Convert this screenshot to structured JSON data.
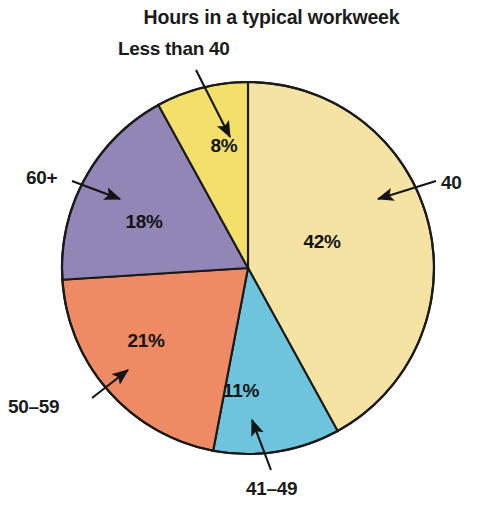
{
  "chart": {
    "title": "Hours in a typical workweek"
  },
  "chart_data": {
    "type": "pie",
    "title": "Hours in a typical workweek",
    "xlabel": "",
    "ylabel": "",
    "grid": false,
    "legend_position": "callout-labels",
    "start_angle_deg": 0,
    "direction": "clockwise",
    "categories": [
      "40",
      "41–49",
      "50–59",
      "60+",
      "Less than 40"
    ],
    "values": [
      42,
      11,
      21,
      18,
      8
    ],
    "value_labels": [
      "42%",
      "11%",
      "21%",
      "18%",
      "8%"
    ],
    "colors": [
      "#f5e3a3",
      "#6ec3dd",
      "#ee8a64",
      "#9186b5",
      "#f2e06a"
    ],
    "slices": [
      {
        "label": "40",
        "value": 42,
        "value_label": "42%",
        "color": "#f5e3a3",
        "start_deg": 0,
        "end_deg": 151.2,
        "pct_label_x": 322,
        "pct_label_y": 242,
        "callout_x": 441,
        "callout_y": 172
      },
      {
        "label": "41–49",
        "value": 11,
        "value_label": "11%",
        "color": "#6ec3dd",
        "start_deg": 151.2,
        "end_deg": 190.8,
        "pct_label_x": 241,
        "pct_label_y": 391,
        "callout_x": 246,
        "callout_y": 478
      },
      {
        "label": "50–59",
        "value": 21,
        "value_label": "21%",
        "color": "#ee8a64",
        "start_deg": 190.8,
        "end_deg": 266.4,
        "pct_label_x": 146,
        "pct_label_y": 341,
        "callout_x": 8,
        "callout_y": 396
      },
      {
        "label": "60+",
        "value": 18,
        "value_label": "18%",
        "color": "#9186b5",
        "start_deg": 266.4,
        "end_deg": 331.2,
        "pct_label_x": 144,
        "pct_label_y": 222,
        "callout_x": 26,
        "callout_y": 167
      },
      {
        "label": "Less than 40",
        "value": 8,
        "value_label": "8%",
        "color": "#f2e06a",
        "start_deg": 331.2,
        "end_deg": 360,
        "pct_label_x": 224,
        "pct_label_y": 146,
        "callout_x": 118,
        "callout_y": 38
      }
    ],
    "geometry": {
      "center_x": 248,
      "center_y": 268,
      "radius": 186,
      "outline_color": "#1a1a1a"
    }
  }
}
